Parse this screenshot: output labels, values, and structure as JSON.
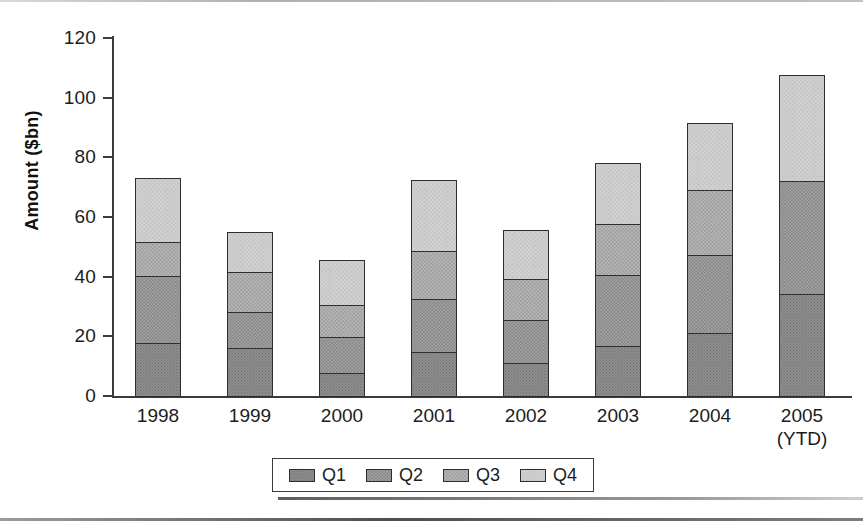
{
  "chart_data": {
    "type": "bar",
    "stacked": true,
    "title": "",
    "xlabel": "",
    "ylabel": "Amount ($bn)",
    "ylim": [
      0,
      120
    ],
    "ytick_values": [
      0,
      20,
      40,
      60,
      80,
      100,
      120
    ],
    "ytick_labels": [
      "0",
      "20",
      "40",
      "60",
      "80",
      "100",
      "120"
    ],
    "grid": false,
    "legend_position": "bottom",
    "categories": [
      "1998",
      "1999",
      "2000",
      "2001",
      "2002",
      "2003",
      "2004",
      "2005"
    ],
    "category_sublabels": [
      "",
      "",
      "",
      "",
      "",
      "",
      "",
      "(YTD)"
    ],
    "series": [
      {
        "name": "Q1",
        "color": "#8e8e8e",
        "values": [
          18,
          16.5,
          8,
          15,
          11.5,
          17,
          21.5,
          34.5
        ]
      },
      {
        "name": "Q2",
        "color": "#a3a3a3",
        "values": [
          23,
          12.5,
          12.5,
          18.5,
          15,
          24.5,
          26.5,
          38.5
        ]
      },
      {
        "name": "Q3",
        "color": "#b8b8b8",
        "values": [
          12,
          14,
          11.5,
          16.5,
          14,
          17.5,
          22.5,
          0
        ]
      },
      {
        "name": "Q4",
        "color": "#d2d2d2",
        "values": [
          22,
          14,
          15.5,
          24.5,
          17,
          21,
          23,
          36
        ]
      }
    ],
    "totals": [
      75,
      57,
      47.5,
      74.5,
      57.5,
      80,
      93.5,
      109
    ]
  },
  "legend": {
    "items": [
      {
        "label": "Q1"
      },
      {
        "label": "Q2"
      },
      {
        "label": "Q3"
      },
      {
        "label": "Q4"
      }
    ]
  }
}
